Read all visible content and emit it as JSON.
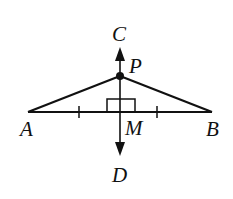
{
  "diagram": {
    "labels": {
      "A": "A",
      "B": "B",
      "C": "C",
      "D": "D",
      "M": "M",
      "P": "P"
    },
    "colors": {
      "stroke": "#111111",
      "background": "#ffffff"
    }
  }
}
